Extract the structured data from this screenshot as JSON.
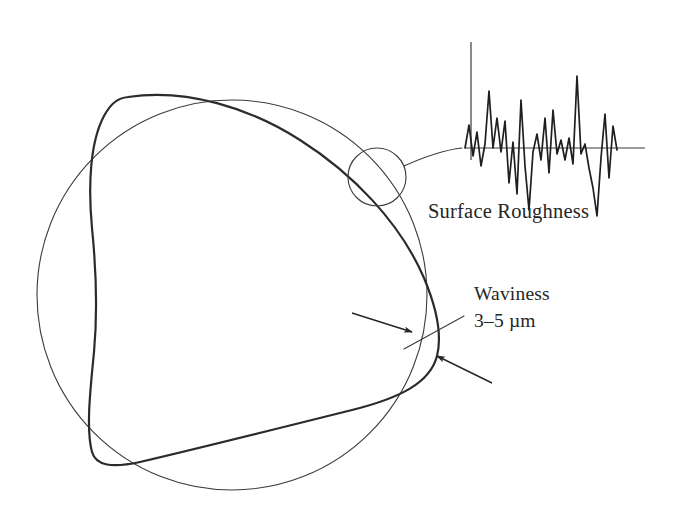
{
  "figure": {
    "background_color": "#ffffff",
    "ink_color": "#262626",
    "thin_line_color": "#3b3b3b",
    "thick_line_color": "#2b2b2b"
  },
  "labels": {
    "roughness": "Surface Roughness",
    "waviness": "Waviness",
    "waviness_value": "3–5 µm"
  },
  "nominal_circle": {
    "name": "nominal-reference-circle",
    "center_x": 232,
    "center_y": 295,
    "radius": 195,
    "stroke_width": 1.1,
    "color": "#3b3b3b"
  },
  "waviness_profile": {
    "name": "waviness-lobed-curve",
    "lobes": 3,
    "stroke_width": 2.2,
    "color": "#2b2b2b",
    "description": "Trilobular exaggerated waviness contour crossing the nominal circle"
  },
  "callout": {
    "name": "roughness-callout-circle",
    "center_x": 377,
    "center_y": 177,
    "radius": 29,
    "leader_from_x": 404,
    "leader_from_y": 166,
    "leader_to_x": 462,
    "leader_to_y": 148
  },
  "arrows": [
    {
      "name": "waviness-arrow-upper",
      "from_x": 352,
      "from_y": 313,
      "to_x": 412,
      "to_y": 332
    },
    {
      "name": "waviness-arrow-lower",
      "from_x": 492,
      "from_y": 383,
      "to_x": 437,
      "to_y": 356
    }
  ],
  "waviness_leader": {
    "name": "waviness-label-leader",
    "from_x": 464,
    "from_y": 316,
    "to_x": 404,
    "to_y": 349
  },
  "chart_data": {
    "type": "line",
    "title": "Surface Roughness",
    "xlabel": "",
    "ylabel": "",
    "axis_origin_x": 471,
    "axis_top_y": 42,
    "baseline_y": 148,
    "baseline_x_start": 465,
    "baseline_x_end": 645,
    "grid": false,
    "legend": null,
    "x": [
      465,
      469,
      473,
      477,
      481,
      485,
      489,
      493,
      497,
      501,
      505,
      509,
      513,
      517,
      521,
      525,
      529,
      533,
      537,
      541,
      545,
      549,
      553,
      557,
      561,
      565,
      569,
      573,
      577,
      581,
      585,
      589,
      593,
      597,
      601,
      605,
      609,
      613,
      617
    ],
    "values": [
      0,
      23,
      -8,
      16,
      -18,
      4,
      57,
      0,
      30,
      -4,
      27,
      -35,
      6,
      -46,
      48,
      -18,
      -62,
      -4,
      14,
      -12,
      30,
      -25,
      38,
      -6,
      8,
      -12,
      10,
      -16,
      72,
      -6,
      4,
      -20,
      -40,
      -68,
      -10,
      34,
      -30,
      22,
      -2
    ],
    "y_units": "arbitrary (exaggerated vertical scale)",
    "note": "Stylized surface-roughness trace about the mean line"
  }
}
